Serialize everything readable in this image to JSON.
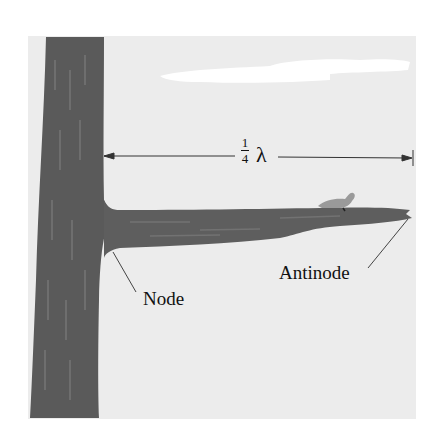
{
  "figure": {
    "dimension": {
      "numerator": "1",
      "denominator": "4",
      "symbol": "λ"
    },
    "labels": {
      "node": "Node",
      "antinode": "Antinode"
    },
    "colors": {
      "background": "#ececec",
      "trunk": "#5a5a5a",
      "branch": "#5e5e5e",
      "line": "#333333"
    }
  }
}
